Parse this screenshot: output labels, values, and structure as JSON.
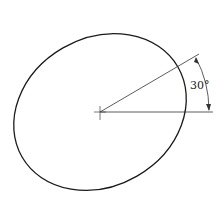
{
  "diagram": {
    "angle_label": "30°",
    "rotation_degrees": 30,
    "colors": {
      "stroke": "#1a1a1a",
      "background": "#ffffff"
    }
  }
}
